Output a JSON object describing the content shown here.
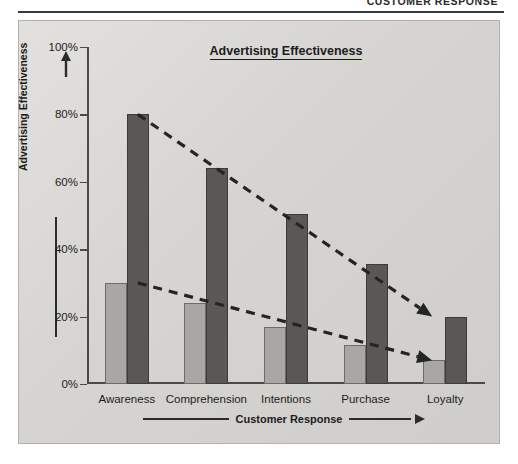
{
  "runhead": {
    "title": "CUSTOMER RESPONSE"
  },
  "panel": {
    "background": "#d6d4d1",
    "border": "#b3b1ae"
  },
  "chart_data": {
    "type": "bar",
    "title": "Advertising Effectiveness",
    "xlabel": "Customer Response",
    "ylabel": "Advertising Effectiveness",
    "categories": [
      "Awareness",
      "Comprehension",
      "Intentions",
      "Purchase",
      "Loyalty"
    ],
    "ylim": [
      0,
      100
    ],
    "yticks": [
      0,
      20,
      40,
      60,
      80,
      100
    ],
    "ytick_labels": [
      "0%",
      "20%",
      "40%",
      "60%",
      "80%",
      "100%"
    ],
    "grid": false,
    "legend": "none",
    "series": [
      {
        "name": "Lower effectiveness",
        "color": "#a9a7a4",
        "values": [
          30,
          24,
          17,
          11.5,
          7
        ]
      },
      {
        "name": "Higher effectiveness",
        "color": "#5a5856",
        "values": [
          80,
          64,
          50.5,
          35.5,
          20
        ]
      }
    ],
    "annotations": [
      {
        "name": "upper-trend-line",
        "style": "dashed-arrow",
        "from": {
          "category": "Awareness",
          "value": 80
        },
        "to": {
          "category": "Loyalty",
          "value": 20
        }
      },
      {
        "name": "lower-trend-line",
        "style": "dashed-arrow",
        "from": {
          "category": "Awareness",
          "value": 30
        },
        "to": {
          "category": "Loyalty",
          "value": 7
        }
      }
    ]
  }
}
